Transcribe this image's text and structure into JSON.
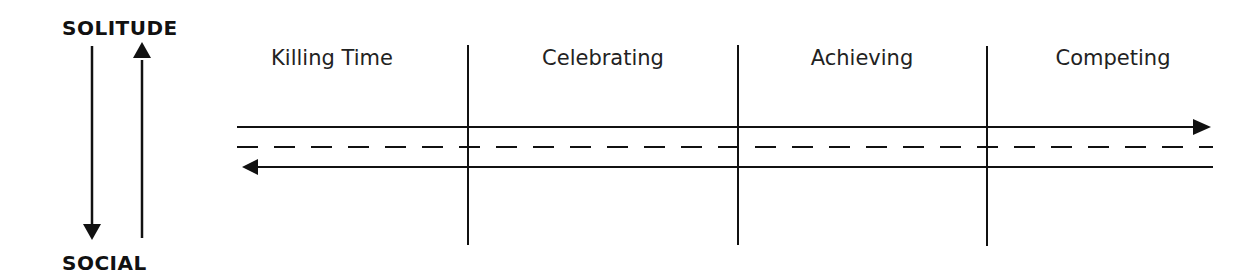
{
  "axis": {
    "top_label": "SOLITUDE",
    "bottom_label": "SOCIAL"
  },
  "phases": [
    {
      "label": "Killing Time",
      "center_x": 332
    },
    {
      "label": "Celebrating",
      "center_x": 603
    },
    {
      "label": "Achieving",
      "center_x": 862
    },
    {
      "label": "Competing",
      "center_x": 1113
    }
  ],
  "dividers_x": [
    468,
    738,
    987
  ],
  "flows": {
    "forward": "solid arrow left-to-right",
    "middle": "dashed line",
    "backward": "solid arrow right-to-left"
  },
  "colors": {
    "line": "#111111",
    "background": "#ffffff"
  }
}
